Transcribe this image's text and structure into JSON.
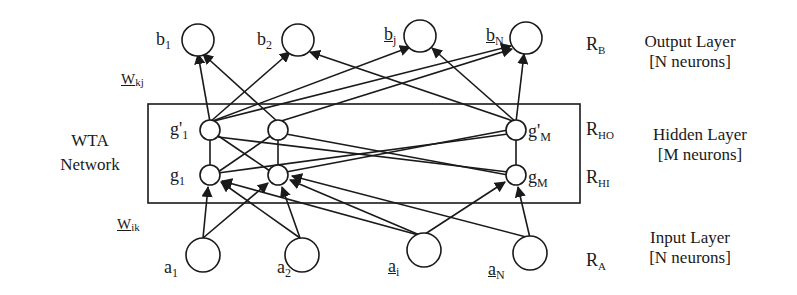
{
  "diagram": {
    "type": "neural-network-architecture",
    "wta_label": [
      "WTA",
      "Network"
    ],
    "layers": {
      "output": {
        "title": "Output Layer",
        "size": "[N neurons]",
        "region": {
          "base": "R",
          "sub": "B"
        }
      },
      "hidden": {
        "title": "Hidden Layer",
        "size": "[M neurons]",
        "regions": [
          {
            "base": "R",
            "sub": "HO"
          },
          {
            "base": "R",
            "sub": "HI"
          }
        ]
      },
      "input": {
        "title": "Input Layer",
        "size": "[N neurons]",
        "region": {
          "base": "R",
          "sub": "A"
        }
      }
    },
    "weights": {
      "top": {
        "base": "W",
        "sub": "kj"
      },
      "bottom": {
        "base": "W",
        "sub": "ik"
      }
    },
    "nodes": {
      "output": [
        {
          "base": "b",
          "sub": "1",
          "underline": false
        },
        {
          "base": "b",
          "sub": "2",
          "underline": false
        },
        {
          "base": "b",
          "sub": "j",
          "underline": true
        },
        {
          "base": "b",
          "sub": "N",
          "underline": true
        }
      ],
      "hidden_out": [
        {
          "base": "g'",
          "sub": "1"
        },
        {
          "base": "",
          "sub": ""
        },
        {
          "base": "g'",
          "sub": "M"
        }
      ],
      "hidden_in": [
        {
          "base": "g",
          "sub": "1"
        },
        {
          "base": "",
          "sub": ""
        },
        {
          "base": "g",
          "sub": "M"
        }
      ],
      "input": [
        {
          "base": "a",
          "sub": "1",
          "underline": false
        },
        {
          "base": "a",
          "sub": "2",
          "underline": false
        },
        {
          "base": "a",
          "sub": "i",
          "underline": true
        },
        {
          "base": "a",
          "sub": "N",
          "underline": true
        }
      ]
    },
    "colors": {
      "stroke": "#1a1a1a",
      "background": "#ffffff"
    }
  }
}
